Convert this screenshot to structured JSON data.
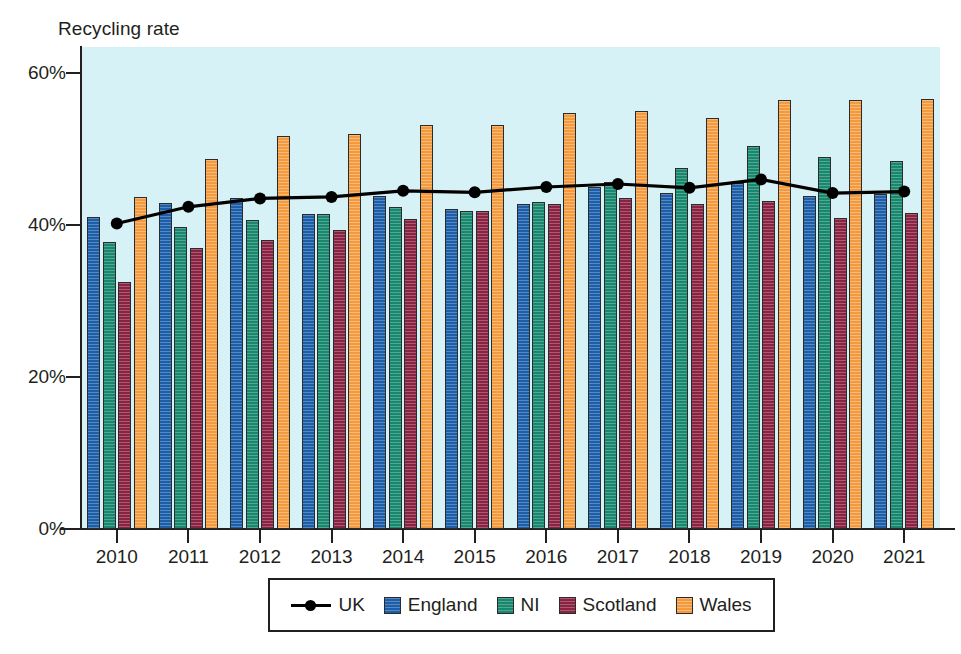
{
  "chart_data": {
    "type": "bar",
    "title": "",
    "ylabel": "Recycling rate",
    "xlabel": "",
    "categories": [
      "2010",
      "2011",
      "2012",
      "2013",
      "2014",
      "2015",
      "2016",
      "2017",
      "2018",
      "2019",
      "2020",
      "2021"
    ],
    "ylim": [
      0,
      60
    ],
    "ytick_values": [
      0,
      20,
      40,
      60
    ],
    "ytick_labels": [
      "0%",
      "20%",
      "40%",
      "60%"
    ],
    "grid": false,
    "legend_position": "bottom",
    "series": [
      {
        "name": "UK",
        "type": "line",
        "color": "#000000",
        "marker": "circle",
        "values": [
          40.2,
          42.4,
          43.5,
          43.7,
          44.5,
          44.3,
          45.0,
          45.4,
          44.9,
          46.0,
          44.2,
          44.4
        ]
      },
      {
        "name": "England",
        "type": "bar",
        "color": "#1c5fa8",
        "values": [
          41.1,
          42.9,
          43.5,
          41.4,
          43.8,
          42.1,
          42.7,
          45.0,
          44.2,
          45.5,
          43.8,
          44.1
        ]
      },
      {
        "name": "NI",
        "type": "bar",
        "color": "#17876d",
        "values": [
          37.7,
          39.7,
          40.6,
          41.4,
          42.4,
          41.8,
          43.0,
          45.6,
          47.5,
          50.4,
          49.0,
          48.4
        ]
      },
      {
        "name": "Scotland",
        "type": "bar",
        "color": "#8a2241",
        "values": [
          32.5,
          37.0,
          38.0,
          39.4,
          40.8,
          41.9,
          42.8,
          43.5,
          42.8,
          43.2,
          40.9,
          41.6
        ]
      },
      {
        "name": "Wales",
        "type": "bar",
        "color": "#f59a3c",
        "values": [
          43.7,
          48.7,
          51.7,
          52.0,
          53.2,
          53.2,
          54.7,
          55.0,
          54.1,
          56.4,
          56.5,
          56.6
        ]
      }
    ]
  },
  "legend": {
    "items": [
      {
        "label": "UK",
        "marker": "line-with-dot",
        "color": "#000000"
      },
      {
        "label": "England",
        "marker": "square",
        "color": "#1c5fa8"
      },
      {
        "label": "NI",
        "marker": "square",
        "color": "#17876d"
      },
      {
        "label": "Scotland",
        "marker": "square",
        "color": "#8a2241"
      },
      {
        "label": "Wales",
        "marker": "square",
        "color": "#f59a3c"
      }
    ]
  },
  "style": {
    "plot_background": "#d7f2f6",
    "axis_color": "#231f20",
    "page_background": "#ffffff"
  }
}
